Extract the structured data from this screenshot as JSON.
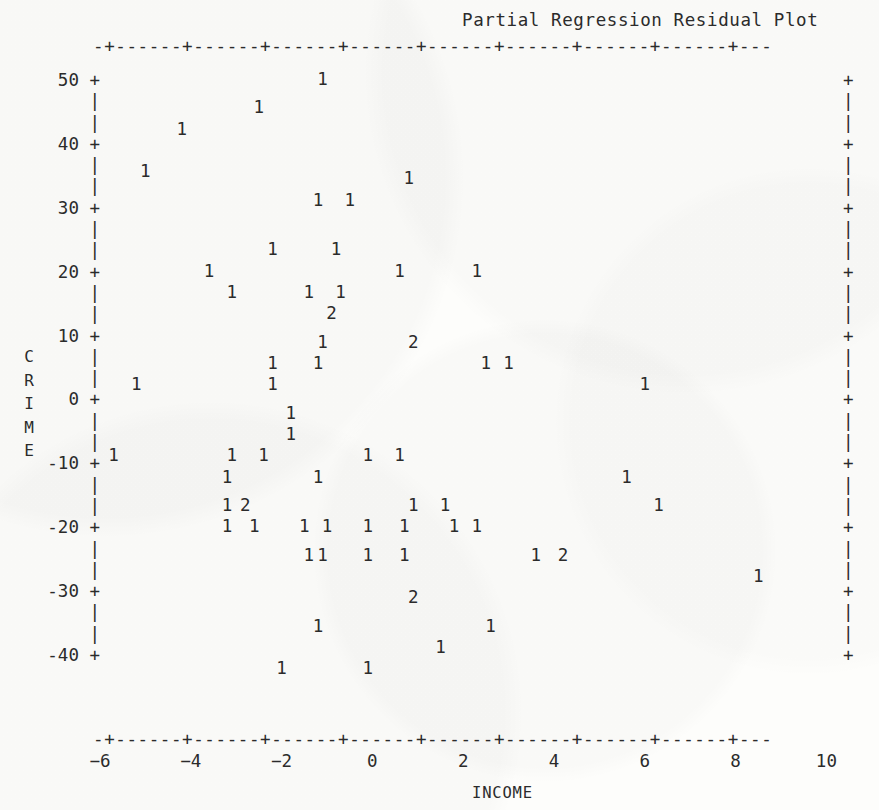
{
  "title": "Partial Regression Residual Plot",
  "axis_frame": {
    "top_rule": "-+------+------+------+------+------+------+------+------+---",
    "bottom_rule": "-+------+------+------+------+------+------+------+------+---",
    "left_column": " 50 +\n    |\n    |\n 40 +\n    |\n    |\n 30 +\n    |\n    |\n 20 +\n    |\n    |\n 10 +\n    |\n    |\n  0 +\n    |\n    |\n-10 +\n    |\n    |\n-20 +\n    |\n    |\n-30 +\n    |\n    |\n-40 +",
    "right_column": "+\n|\n|\n+\n|\n|\n+\n|\n|\n+\n|\n|\n+\n|\n|\n+\n|\n|\n+\n|\n|\n+\n|\n|\n+\n|\n|\n+"
  },
  "ylabel_chars": [
    "C",
    "R",
    "I",
    "M",
    "E"
  ],
  "xlabel": "INCOME",
  "colors": {
    "ink": "#2b2b2b",
    "paper": "#fdfdfb"
  },
  "chart_data": {
    "type": "scatter",
    "title": "Partial Regression Residual Plot",
    "xlabel": "INCOME",
    "ylabel": "CRIME",
    "xlim": [
      -6.9,
      11.0
    ],
    "ylim": [
      -40,
      52
    ],
    "xticks": [
      -6,
      -4,
      -2,
      0,
      2,
      4,
      6,
      8,
      10
    ],
    "yticks": [
      50,
      40,
      30,
      20,
      10,
      0,
      -10,
      -20,
      -30,
      -40
    ],
    "grid": false,
    "legend": null,
    "marker_note": "Glyph is the count of observations at that cell: '1' = one point, '2' = two coincident points.",
    "points": [
      {
        "x": -1.1,
        "y": 50,
        "label": "1"
      },
      {
        "x": -2.5,
        "y": 46,
        "label": "1"
      },
      {
        "x": -4.2,
        "y": 43,
        "label": "1"
      },
      {
        "x": -5.0,
        "y": 37,
        "label": "1"
      },
      {
        "x": 0.8,
        "y": 36,
        "label": "1"
      },
      {
        "x": -1.2,
        "y": 33,
        "label": "1"
      },
      {
        "x": -0.5,
        "y": 33,
        "label": "1"
      },
      {
        "x": -2.2,
        "y": 26,
        "label": "1"
      },
      {
        "x": -0.8,
        "y": 26,
        "label": "1"
      },
      {
        "x": -3.6,
        "y": 23,
        "label": "1"
      },
      {
        "x": 0.6,
        "y": 23,
        "label": "1"
      },
      {
        "x": 2.3,
        "y": 23,
        "label": "1"
      },
      {
        "x": -3.1,
        "y": 20,
        "label": "1"
      },
      {
        "x": -1.4,
        "y": 20,
        "label": "1"
      },
      {
        "x": -0.7,
        "y": 20,
        "label": "1"
      },
      {
        "x": -0.9,
        "y": 17,
        "label": "2"
      },
      {
        "x": -1.1,
        "y": 13,
        "label": "1"
      },
      {
        "x": 0.9,
        "y": 13,
        "label": "2"
      },
      {
        "x": -2.2,
        "y": 10,
        "label": "1"
      },
      {
        "x": -1.2,
        "y": 10,
        "label": "1"
      },
      {
        "x": 2.5,
        "y": 10,
        "label": "1"
      },
      {
        "x": 3.0,
        "y": 10,
        "label": "1"
      },
      {
        "x": -5.2,
        "y": 7,
        "label": "1"
      },
      {
        "x": -2.2,
        "y": 7,
        "label": "1"
      },
      {
        "x": 6.0,
        "y": 7,
        "label": "1"
      },
      {
        "x": -1.8,
        "y": 3,
        "label": "1"
      },
      {
        "x": -1.8,
        "y": 0,
        "label": "1"
      },
      {
        "x": -5.7,
        "y": -3,
        "label": "1"
      },
      {
        "x": -3.1,
        "y": -3,
        "label": "1"
      },
      {
        "x": -2.4,
        "y": -3,
        "label": "1"
      },
      {
        "x": -0.1,
        "y": -3,
        "label": "1"
      },
      {
        "x": 0.6,
        "y": -3,
        "label": "1"
      },
      {
        "x": -3.2,
        "y": -6,
        "label": "1"
      },
      {
        "x": -1.2,
        "y": -6,
        "label": "1"
      },
      {
        "x": 5.6,
        "y": -6,
        "label": "1"
      },
      {
        "x": -3.2,
        "y": -10,
        "label": "1"
      },
      {
        "x": -2.8,
        "y": -10,
        "label": "2"
      },
      {
        "x": 0.9,
        "y": -10,
        "label": "1"
      },
      {
        "x": 1.6,
        "y": -10,
        "label": "1"
      },
      {
        "x": 6.3,
        "y": -10,
        "label": "1"
      },
      {
        "x": -3.2,
        "y": -13,
        "label": "1"
      },
      {
        "x": -2.6,
        "y": -13,
        "label": "1"
      },
      {
        "x": -1.5,
        "y": -13,
        "label": "1"
      },
      {
        "x": -1.0,
        "y": -13,
        "label": "1"
      },
      {
        "x": -0.1,
        "y": -13,
        "label": "1"
      },
      {
        "x": 0.7,
        "y": -13,
        "label": "1"
      },
      {
        "x": 1.8,
        "y": -13,
        "label": "1"
      },
      {
        "x": 2.3,
        "y": -13,
        "label": "1"
      },
      {
        "x": -1.4,
        "y": -17,
        "label": "1"
      },
      {
        "x": -1.1,
        "y": -17,
        "label": "1"
      },
      {
        "x": -0.1,
        "y": -17,
        "label": "1"
      },
      {
        "x": 0.7,
        "y": -17,
        "label": "1"
      },
      {
        "x": 3.6,
        "y": -17,
        "label": "1"
      },
      {
        "x": 4.2,
        "y": -17,
        "label": "2"
      },
      {
        "x": 8.5,
        "y": -20,
        "label": "1"
      },
      {
        "x": 0.9,
        "y": -23,
        "label": "2"
      },
      {
        "x": -1.2,
        "y": -27,
        "label": "1"
      },
      {
        "x": 2.6,
        "y": -27,
        "label": "1"
      },
      {
        "x": 1.5,
        "y": -30,
        "label": "1"
      },
      {
        "x": -2.0,
        "y": -33,
        "label": "1"
      },
      {
        "x": -0.1,
        "y": -33,
        "label": "1"
      }
    ]
  }
}
